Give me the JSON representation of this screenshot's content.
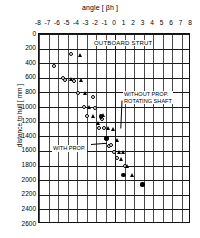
{
  "chart_data": {
    "type": "scatter",
    "title": "OUTBOARD STRUT",
    "xlabel": "angle [ βh ]",
    "ylabel": "distance to hull [ mm ]",
    "xlim": [
      -8,
      8
    ],
    "ylim": [
      0,
      2600
    ],
    "y_inverted": true,
    "grid": true,
    "x_ticks": [
      -8,
      -7,
      -6,
      -5,
      -4,
      -3,
      -2,
      -1,
      0,
      1,
      2,
      3,
      4,
      5,
      6,
      7,
      8
    ],
    "x_ticklabels": [
      "-8",
      "-7",
      "-6",
      "-5",
      "-4",
      "-3",
      "-2",
      "-1",
      "0",
      "1",
      "2",
      "3",
      "4",
      "5",
      "6",
      "7",
      "8"
    ],
    "y_ticks": [
      0,
      200,
      400,
      600,
      800,
      1000,
      1200,
      1400,
      1600,
      1800,
      2000,
      2200,
      2400,
      2600
    ],
    "y_ticklabels": [
      "0",
      "200",
      "400",
      "600",
      "800",
      "1000",
      "1200",
      "1400",
      "1600",
      "1800",
      "2000",
      "2200",
      "2400",
      "2600"
    ],
    "legend_position": "none",
    "annotations": [
      {
        "text_line1": "WITHOUT PROP.",
        "text_line2": "ROTATING SHAFT",
        "target_x": 0.4,
        "target_y": 1310
      },
      {
        "text_line1": "WITH PROP.",
        "text_line2": "",
        "target_x": -0.7,
        "target_y": 1530
      }
    ],
    "series": [
      {
        "name": "WITH PROP.",
        "marker": "open-circle",
        "points": [
          {
            "x": -6.4,
            "y": 440
          },
          {
            "x": -5.5,
            "y": 600
          },
          {
            "x": -5.3,
            "y": 630
          },
          {
            "x": -4.6,
            "y": 280
          },
          {
            "x": -4.3,
            "y": 640
          },
          {
            "x": -3.9,
            "y": 810
          },
          {
            "x": -3.3,
            "y": 1000
          },
          {
            "x": -3.0,
            "y": 1120
          },
          {
            "x": -2.3,
            "y": 860
          },
          {
            "x": -2.1,
            "y": 1010
          },
          {
            "x": -1.7,
            "y": 1290
          },
          {
            "x": -1.4,
            "y": 1160
          },
          {
            "x": -1.2,
            "y": 1290
          },
          {
            "x": -1.0,
            "y": 1440
          },
          {
            "x": -0.8,
            "y": 1430
          },
          {
            "x": -0.6,
            "y": 1530
          },
          {
            "x": -0.4,
            "y": 1520
          },
          {
            "x": -0.1,
            "y": 1610
          },
          {
            "x": 0.2,
            "y": 1700
          },
          {
            "x": 1.1,
            "y": 1810
          }
        ]
      },
      {
        "name": "WITHOUT PROP. ROTATING SHAFT",
        "marker": "filled-triangle",
        "points": [
          {
            "x": -4.6,
            "y": 620
          },
          {
            "x": -3.6,
            "y": 290
          },
          {
            "x": -3.5,
            "y": 640
          },
          {
            "x": -3.1,
            "y": 810
          },
          {
            "x": -2.7,
            "y": 1010
          },
          {
            "x": -2.3,
            "y": 1130
          },
          {
            "x": -1.7,
            "y": 1230
          },
          {
            "x": -1.2,
            "y": 1120
          },
          {
            "x": -0.7,
            "y": 1290
          },
          {
            "x": -0.2,
            "y": 1310
          },
          {
            "x": 0.3,
            "y": 1450
          },
          {
            "x": 0.5,
            "y": 1620
          },
          {
            "x": 0.7,
            "y": 1710
          },
          {
            "x": 0.9,
            "y": 1620
          },
          {
            "x": 1.3,
            "y": 1810
          },
          {
            "x": 1.9,
            "y": 1930
          },
          {
            "x": 2.9,
            "y": 2060
          }
        ]
      },
      {
        "name": "filled-circle-points",
        "marker": "filled-circle",
        "points": [
          {
            "x": -1.5,
            "y": 1130
          },
          {
            "x": -0.9,
            "y": 1420
          },
          {
            "x": 0.9,
            "y": 1930
          },
          {
            "x": 2.9,
            "y": 2060
          }
        ]
      }
    ]
  }
}
